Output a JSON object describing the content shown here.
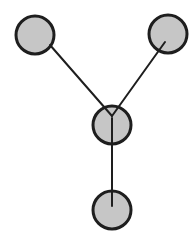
{
  "diagram": {
    "type": "tree-graph",
    "colors": {
      "node_fill": "#c6c6c6",
      "node_stroke": "#1e1e1e",
      "edge_stroke": "#1e1e1e",
      "background": "#ffffff"
    },
    "nodes": [
      {
        "id": "top-left",
        "cx": 35,
        "cy": 35,
        "r": 19
      },
      {
        "id": "top-right",
        "cx": 168,
        "cy": 34,
        "r": 19
      },
      {
        "id": "center",
        "cx": 112,
        "cy": 125,
        "r": 19
      },
      {
        "id": "bottom",
        "cx": 112,
        "cy": 210,
        "r": 19
      }
    ],
    "edges": [
      {
        "from": "top-left",
        "to": "center",
        "x1": 50,
        "y1": 45,
        "x2": 112,
        "y2": 116
      },
      {
        "from": "top-right",
        "to": "center",
        "x1": 165,
        "y1": 42,
        "x2": 112,
        "y2": 116
      },
      {
        "from": "center",
        "to": "bottom",
        "x1": 112,
        "y1": 118,
        "x2": 112,
        "y2": 206
      }
    ]
  }
}
